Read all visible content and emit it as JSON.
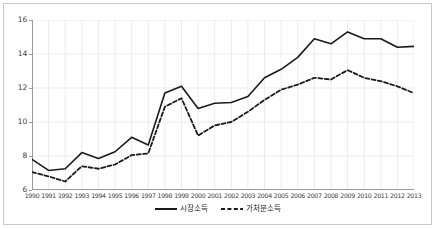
{
  "chart_data": {
    "type": "line",
    "title": "",
    "xlabel": "",
    "ylabel": "",
    "x": [
      1990,
      1991,
      1992,
      1993,
      1994,
      1995,
      1996,
      1997,
      1998,
      1999,
      2000,
      2001,
      2002,
      2003,
      2004,
      2005,
      2006,
      2007,
      2008,
      2009,
      2010,
      2011,
      2012,
      2013
    ],
    "categories": [
      "1990",
      "1991",
      "1992",
      "1993",
      "1994",
      "1995",
      "1996",
      "1997",
      "1998",
      "1999",
      "2000",
      "2001",
      "2002",
      "2003",
      "2004",
      "2005",
      "2006",
      "2007",
      "2008",
      "2009",
      "2010",
      "2011",
      "2012",
      "2013"
    ],
    "xlim": [
      1990,
      2013
    ],
    "ylim": [
      6,
      16
    ],
    "yticks": [
      6,
      8,
      10,
      12,
      14,
      16
    ],
    "grid": true,
    "legend_position": "bottom",
    "series": [
      {
        "name": "시장소득",
        "style": "solid",
        "color": "#1a1a1a",
        "values": [
          7.8,
          7.15,
          7.25,
          8.2,
          7.85,
          8.25,
          9.1,
          8.65,
          11.7,
          12.1,
          10.8,
          11.1,
          11.15,
          11.5,
          12.6,
          13.1,
          13.8,
          14.9,
          14.6,
          15.3,
          14.9,
          14.9,
          14.4,
          14.45
        ]
      },
      {
        "name": "가처분소득",
        "style": "dashed",
        "color": "#1a1a1a",
        "values": [
          7.05,
          6.8,
          6.5,
          7.4,
          7.25,
          7.5,
          8.05,
          8.15,
          10.9,
          11.4,
          9.2,
          9.8,
          10.0,
          10.6,
          11.3,
          11.9,
          12.2,
          12.6,
          12.5,
          13.05,
          12.6,
          12.4,
          12.1,
          11.7
        ]
      }
    ]
  }
}
